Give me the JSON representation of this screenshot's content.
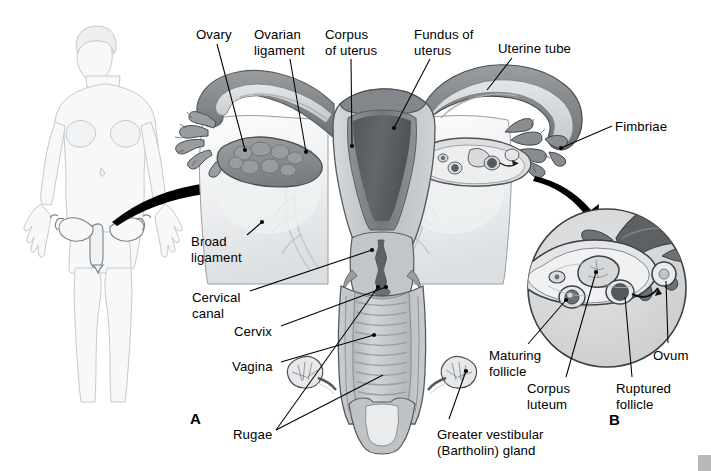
{
  "figure": {
    "panels": [
      {
        "id": "A",
        "letter": "A",
        "x": 190,
        "y": 410
      },
      {
        "id": "B",
        "letter": "B",
        "x": 609,
        "y": 411
      }
    ]
  },
  "labels": [
    {
      "id": "ovary",
      "text": "Ovary",
      "x": 196,
      "y": 27,
      "align": "left"
    },
    {
      "id": "ovarian-ligament",
      "text": "Ovarian\nligament",
      "x": 254,
      "y": 27,
      "align": "left"
    },
    {
      "id": "corpus-uteri",
      "text": "Corpus\nof uterus",
      "x": 325,
      "y": 27,
      "align": "left"
    },
    {
      "id": "fundus-uteri",
      "text": "Fundus of\nuterus",
      "x": 414,
      "y": 27,
      "align": "left"
    },
    {
      "id": "uterine-tube",
      "text": "Uterine tube",
      "x": 498,
      "y": 41,
      "align": "left"
    },
    {
      "id": "fimbriae",
      "text": "Fimbriae",
      "x": 615,
      "y": 119,
      "align": "left"
    },
    {
      "id": "broad-ligament",
      "text": "Broad\nligament",
      "x": 191,
      "y": 234,
      "align": "left"
    },
    {
      "id": "cervical-canal",
      "text": "Cervical\ncanal",
      "x": 192,
      "y": 290,
      "align": "left"
    },
    {
      "id": "cervix",
      "text": "Cervix",
      "x": 234,
      "y": 324,
      "align": "left"
    },
    {
      "id": "vagina",
      "text": "Vagina",
      "x": 232,
      "y": 359,
      "align": "left"
    },
    {
      "id": "rugae",
      "text": "Rugae",
      "x": 233,
      "y": 427,
      "align": "left"
    },
    {
      "id": "bartholin-gland",
      "text": "Greater vestibular\n(Bartholin) gland",
      "x": 437,
      "y": 427,
      "align": "left"
    },
    {
      "id": "maturing-follicle",
      "text": "Maturing\nfollicle",
      "x": 489,
      "y": 348,
      "align": "left"
    },
    {
      "id": "corpus-luteum",
      "text": "Corpus\nluteum",
      "x": 527,
      "y": 381,
      "align": "left"
    },
    {
      "id": "ruptured-follicle",
      "text": "Ruptured\nfollicle",
      "x": 616,
      "y": 381,
      "align": "left"
    },
    {
      "id": "ovum",
      "text": "Ovum",
      "x": 653,
      "y": 348,
      "align": "left"
    }
  ],
  "colors": {
    "outline": "#4d4d4d",
    "line": "#000000",
    "body_outline": "#c9cdd1",
    "body_fill": "#f4f6f7",
    "broad_ligament": "#e9eaec",
    "uterus_wall": "#c3c6c8",
    "uterus_wall_dark": "#9a9da0",
    "endometrium": "#6f7275",
    "cavity": "#5a5d60",
    "tube_outer": "#8e9194",
    "tube_dark": "#707376",
    "ovary_fill": "#8b8e91",
    "vagina_wall": "#b5b8bb",
    "vagina_lumen": "#c8cbcd",
    "inset_bg": "#d8dadc",
    "arrow": "#000000",
    "corner_mark": "#b9b9b9"
  },
  "structures": [
    {
      "id": "female-body-figure",
      "name": "anterior female body outline with uterus highlighted"
    },
    {
      "id": "left-ovary",
      "name": "left ovary, lobulated gray mass"
    },
    {
      "id": "left-uterine-tube",
      "name": "left uterine tube with fimbriae"
    },
    {
      "id": "right-ovary",
      "name": "right ovary sectioned showing follicles"
    },
    {
      "id": "right-uterine-tube",
      "name": "right uterine tube with fimbriae"
    },
    {
      "id": "uterus-body",
      "name": "uterus with fundus, corpus and cavity"
    },
    {
      "id": "cervix-canal",
      "name": "cervix and cervical canal"
    },
    {
      "id": "vagina",
      "name": "vagina with rugae"
    },
    {
      "id": "broad-ligament-sheet",
      "name": "broad ligament"
    },
    {
      "id": "bartholin-left",
      "name": "left greater vestibular gland"
    },
    {
      "id": "bartholin-right",
      "name": "right greater vestibular gland"
    },
    {
      "id": "inset-circle",
      "name": "panel B magnified ovary inset"
    },
    {
      "id": "pointer-arrow-a",
      "name": "arrow from body figure to panel A"
    },
    {
      "id": "pointer-arrow-b",
      "name": "arrow from right ovary to panel B"
    }
  ]
}
